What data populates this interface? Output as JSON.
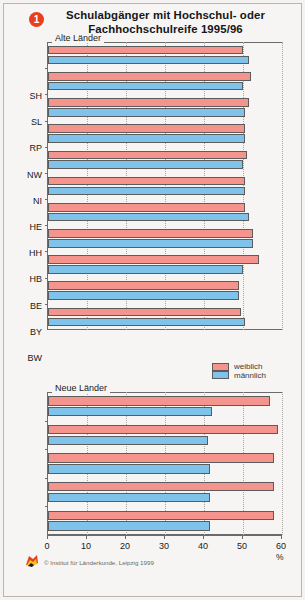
{
  "figure": {
    "badge_number": "1",
    "title_line1": "Schulabgänger mit Hochschul- oder",
    "title_line2": "Fachhochschulreife 1995/96",
    "unit": "%",
    "copyright": "© Institut für Länderkunde, Leipzig 1999",
    "colors": {
      "female": "#f4948c",
      "male": "#7fc3ea",
      "badge": "#e8401a",
      "background": "#f6f5f3",
      "axis": "#6b6b6b"
    }
  },
  "legend": {
    "position": "middle-right",
    "entries": [
      {
        "label": "weiblich",
        "color": "#f4948c"
      },
      {
        "label": "männlich",
        "color": "#7fc3ea"
      }
    ]
  },
  "panels": {
    "top": {
      "label": "Alte Länder"
    },
    "bottom": {
      "label": "Neue Länder"
    }
  },
  "axis": {
    "label": "%",
    "ticks": [
      "0",
      "10",
      "20",
      "30",
      "40",
      "50",
      "60"
    ],
    "min": 0,
    "max": 60
  },
  "chart_data": {
    "type": "bar",
    "orientation": "horizontal",
    "title": "Schulabgänger mit Hochschul- oder Fachhochschulreife 1995/96",
    "xlabel": "%",
    "ylabel": "",
    "xlim": [
      0,
      60
    ],
    "xticks": [
      0,
      10,
      20,
      30,
      40,
      50,
      60
    ],
    "grid": true,
    "grid_axis": "x",
    "legend_position": "middle-right",
    "groups": [
      {
        "name": "Alte Länder",
        "categories": [
          "SH",
          "SL",
          "RP",
          "NW",
          "NI",
          "HE",
          "HH",
          "HB",
          "BE",
          "BY",
          "BW"
        ],
        "series": [
          {
            "name": "weiblich",
            "color": "#f4948c",
            "values": [
              50.0,
              52.0,
              51.5,
              50.5,
              51.0,
              50.5,
              50.5,
              52.5,
              54.0,
              49.0,
              49.5
            ]
          },
          {
            "name": "männlich",
            "color": "#7fc3ea",
            "values": [
              51.5,
              50.0,
              50.5,
              50.5,
              50.0,
              50.5,
              51.5,
              52.5,
              50.0,
              49.0,
              50.5
            ]
          }
        ]
      },
      {
        "name": "Neue Länder",
        "categories": [
          "TH",
          "ST",
          "SN",
          "MV",
          "BB"
        ],
        "series": [
          {
            "name": "weiblich",
            "color": "#f4948c",
            "values": [
              57.0,
              59.0,
              58.0,
              58.0,
              58.0
            ]
          },
          {
            "name": "männlich",
            "color": "#7fc3ea",
            "values": [
              42.0,
              41.0,
              41.5,
              41.5,
              41.5
            ]
          }
        ]
      }
    ]
  }
}
